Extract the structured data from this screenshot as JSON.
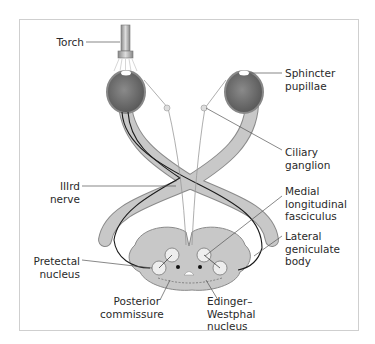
{
  "figure": {
    "labels": {
      "torch": "Torch",
      "sphincter_pupillae": "Sphincter\npupillae",
      "ciliary_ganglion": "Ciliary\nganglion",
      "third_nerve": "IIIrd\nnerve",
      "medial_longitudinal_fasciculus": "Medial\nlongitudinal\nfasciculus",
      "lateral_geniculate_body": "Lateral\ngeniculate\nbody",
      "pretectal_nucleus": "Pretectal\nnucleus",
      "posterior_commissure": "Posterior\ncommissure",
      "edinger_westphal_nucleus": "Edinger–\nWestphal\nnucleus"
    },
    "colors": {
      "pathway_fill": "#c8c8c8",
      "pathway_edge": "#8a8a8a",
      "eye_fill": "#6e6e6e",
      "nerve_line": "#1a1a1a",
      "leader_line": "#555555",
      "frame": "#cfcfcf"
    }
  }
}
